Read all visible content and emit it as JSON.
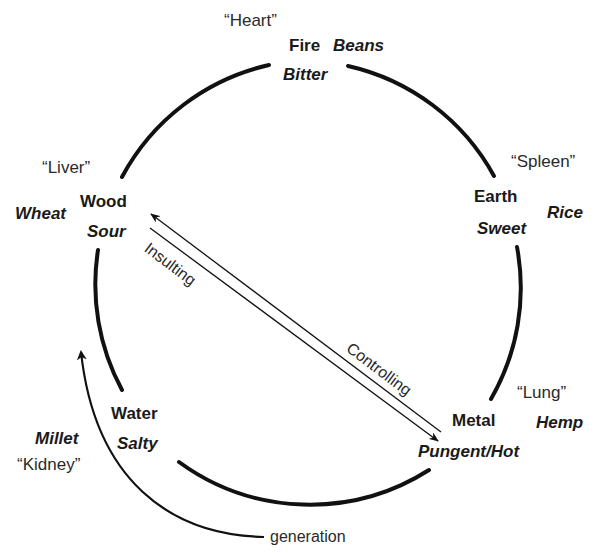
{
  "diagram": {
    "type": "five-phases-cycle",
    "nodes": [
      {
        "id": "fire",
        "element": "Fire",
        "taste": "Bitter",
        "grain": "Beans",
        "organ": "“Heart”"
      },
      {
        "id": "earth",
        "element": "Earth",
        "taste": "Sweet",
        "grain": "Rice",
        "organ": "“Spleen”"
      },
      {
        "id": "metal",
        "element": "Metal",
        "taste": "Pungent/Hot",
        "grain": "Hemp",
        "organ": "“Lung”"
      },
      {
        "id": "water",
        "element": "Water",
        "taste": "Salty",
        "grain": "Millet",
        "organ": "“Kidney”"
      },
      {
        "id": "wood",
        "element": "Wood",
        "taste": "Sour",
        "grain": "Wheat",
        "organ": "“Liver”"
      }
    ],
    "relations": {
      "generation": "generation",
      "controlling": "Controlling",
      "insulting": "Insulting"
    },
    "colors": {
      "stroke": "#111111",
      "text": "#1a1a1a"
    }
  }
}
